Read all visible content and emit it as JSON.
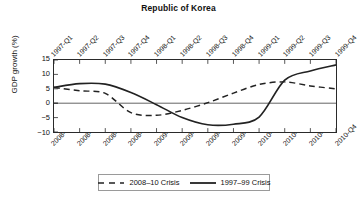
{
  "chart_data": {
    "type": "line",
    "title": "Republic of Korea",
    "xlabel": "",
    "ylabel": "GDP growth (%)",
    "ylim": [
      -10,
      15
    ],
    "yticks": [
      15,
      10,
      5,
      0,
      -5,
      -10
    ],
    "ytick_labels": [
      "15",
      "10",
      "5",
      "0",
      "−5",
      "−10"
    ],
    "grid": false,
    "zero_line": true,
    "legend_position": "bottom-center",
    "top_axis_label": "1997–99 quarters",
    "bottom_axis_label": "2008–10 quarters",
    "categories_top": [
      "1997-Q1",
      "1997-Q2",
      "1997-Q3",
      "1997-Q4",
      "1998-Q1",
      "1998-Q2",
      "1998-Q3",
      "1998-Q4",
      "1999-Q1",
      "1999-Q2",
      "1999-Q3",
      "1999-Q4"
    ],
    "categories_bottom": [
      "2008-Q1",
      "2008-Q2",
      "2008-Q3",
      "2008-Q4",
      "2009-Q1",
      "2009-Q2",
      "2009-Q3",
      "2009-Q4",
      "2010-Q1",
      "2010-Q2",
      "2010-Q3",
      "2010-Q4"
    ],
    "series": [
      {
        "name": "2008–10 Crisis",
        "style": "dashed",
        "axis": "bottom",
        "color": "#222222",
        "values": [
          5.5,
          4.3,
          3.4,
          -3.3,
          -4.2,
          -2.5,
          0.2,
          3.5,
          6.5,
          7.4,
          6.0,
          5.0
        ]
      },
      {
        "name": "1997–99 Crisis",
        "style": "solid",
        "axis": "top",
        "color": "#222222",
        "values": [
          5.5,
          6.8,
          6.6,
          3.7,
          -0.5,
          -5.0,
          -7.5,
          -7.3,
          -4.8,
          8.0,
          11.2,
          13.3
        ]
      }
    ]
  },
  "legend": {
    "items": [
      {
        "label": "2008–10 Crisis",
        "style": "dashed"
      },
      {
        "label": "1997–99 Crisis",
        "style": "solid"
      }
    ]
  }
}
